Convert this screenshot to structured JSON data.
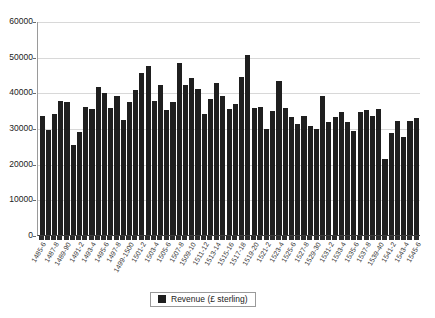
{
  "chart_data": {
    "type": "bar",
    "title": "",
    "xlabel": "",
    "ylabel": "",
    "ylim": [
      0,
      60000
    ],
    "ytick_step": 10000,
    "yticks": [
      "0",
      "10000",
      "20000",
      "30000",
      "40000",
      "50000",
      "60000"
    ],
    "grid": true,
    "legend_position": "bottom",
    "series_color": "#1f1f1f",
    "legend": [
      "Revenue (£ sterling)"
    ],
    "categories": [
      "1485-6",
      "1486-7",
      "1487-8",
      "1488-9",
      "1489-90",
      "1490-1",
      "1491-2",
      "1492-3",
      "1493-4",
      "1494-5",
      "1495-6",
      "1496-7",
      "1497-8",
      "1498-9",
      "1499-1500",
      "1500-1",
      "1501-2",
      "1502-3",
      "1503-4",
      "1504-5",
      "1505-6",
      "1506-7",
      "1507-8",
      "1508-9",
      "1509-10",
      "1510-11",
      "1511-12",
      "1512-13",
      "1513-14",
      "1514-15",
      "1515-16",
      "1516-17",
      "1517-18",
      "1518-19",
      "1519-20",
      "1520-1",
      "1521-2",
      "1522-3",
      "1523-4",
      "1524-5",
      "1525-6",
      "1526-7",
      "1527-8",
      "1528-9",
      "1529-30",
      "1530-1",
      "1531-2",
      "1532-3",
      "1533-4",
      "1534-5",
      "1535-6",
      "1536-7",
      "1537-8",
      "1538-9",
      "1539-40",
      "1540-1",
      "1541-2",
      "1542-3",
      "1543-4",
      "1544-5",
      "1545-6"
    ],
    "tick_labels_shown": [
      "1485-6",
      "1487-8",
      "1489-90",
      "1491-2",
      "1493-4",
      "1495-6",
      "1497-8",
      "1499-1500",
      "1501-2",
      "1503-4",
      "1505-6",
      "1507-8",
      "1509-10",
      "1511-12",
      "1513-14",
      "1515-16",
      "1517-18",
      "1519-20",
      "1521-2",
      "1523-4",
      "1525-6",
      "1527-8",
      "1529-30",
      "1531-2",
      "1533-4",
      "1535-6",
      "1537-8",
      "1539-40",
      "1541-2",
      "1543-4",
      "1545-6"
    ],
    "values": [
      33500,
      29400,
      34000,
      37700,
      37200,
      25300,
      28800,
      36000,
      35400,
      41400,
      39700,
      35500,
      39000,
      32300,
      37200,
      40700,
      45400,
      47400,
      37700,
      42200,
      35100,
      37200,
      48100,
      42100,
      44000,
      40800,
      33900,
      38200,
      42500,
      39000,
      35300,
      36800,
      44300,
      50400,
      35600,
      36000,
      29600,
      34900,
      43300,
      35500,
      33000,
      31200,
      33500,
      30500,
      29700,
      38900,
      31700,
      33100,
      34500,
      31700,
      29300,
      34600,
      35000,
      33500,
      35300,
      21400,
      28500,
      32000,
      27500,
      31900,
      32900
    ]
  }
}
